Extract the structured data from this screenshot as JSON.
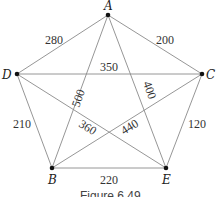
{
  "figure": {
    "caption": "Figure 6.49",
    "nodes": [
      {
        "id": "A",
        "label": "A",
        "x": 108,
        "y": 15
      },
      {
        "id": "B",
        "label": "B",
        "x": 52,
        "y": 168
      },
      {
        "id": "C",
        "label": "C",
        "x": 202,
        "y": 74
      },
      {
        "id": "D",
        "label": "D",
        "x": 17,
        "y": 74
      },
      {
        "id": "E",
        "label": "E",
        "x": 166,
        "y": 168
      }
    ],
    "edges": [
      {
        "from": "A",
        "to": "D",
        "weight": "280"
      },
      {
        "from": "A",
        "to": "C",
        "weight": "200"
      },
      {
        "from": "D",
        "to": "C",
        "weight": "350"
      },
      {
        "from": "A",
        "to": "B",
        "weight": "500"
      },
      {
        "from": "A",
        "to": "E",
        "weight": "400"
      },
      {
        "from": "D",
        "to": "E",
        "weight": "360"
      },
      {
        "from": "C",
        "to": "B",
        "weight": "440"
      },
      {
        "from": "D",
        "to": "B",
        "weight": "210"
      },
      {
        "from": "C",
        "to": "E",
        "weight": "120"
      },
      {
        "from": "B",
        "to": "E",
        "weight": "220"
      }
    ]
  }
}
